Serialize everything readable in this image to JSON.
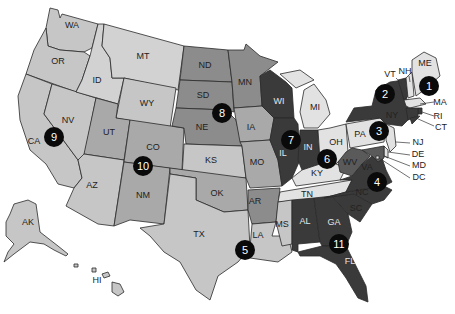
{
  "map": {
    "title": "United States map",
    "shade_levels": {
      "lightest": "#e2e2e2",
      "light": "#c6c6c6",
      "medium": "#a9a9a9",
      "medium_dark": "#8c8c8c",
      "dark": "#5a5a5a",
      "darkest": "#3a3a3a"
    },
    "states": {
      "WA": "WA",
      "OR": "OR",
      "CA": "CA",
      "NV": "NV",
      "ID": "ID",
      "MT": "MT",
      "WY": "WY",
      "UT": "UT",
      "AZ": "AZ",
      "CO": "CO",
      "NM": "NM",
      "ND": "ND",
      "SD": "SD",
      "NE": "NE",
      "KS": "KS",
      "OK": "OK",
      "TX": "TX",
      "MN": "MN",
      "IA": "IA",
      "MO": "MO",
      "AR": "AR",
      "LA": "LA",
      "WI": "WI",
      "IL": "IL",
      "MI": "MI",
      "IN": "IN",
      "OH": "OH",
      "KY": "KY",
      "TN": "TN",
      "MS": "MS",
      "AL": "AL",
      "GA": "GA",
      "FL": "FL",
      "SC": "SC",
      "NC": "NC",
      "VA": "VA",
      "WV": "WV",
      "PA": "PA",
      "NY": "NY",
      "VT": "VT",
      "NH": "NH",
      "ME": "ME",
      "MA": "MA",
      "RI": "RI",
      "CT": "CT",
      "NJ": "NJ",
      "DE": "DE",
      "MD": "MD",
      "DC": "DC",
      "AK": "AK",
      "HI": "HI"
    },
    "markers": [
      {
        "number": "1",
        "state": "ME"
      },
      {
        "number": "2",
        "state": "NY"
      },
      {
        "number": "3",
        "state": "PA"
      },
      {
        "number": "4",
        "state": "VA"
      },
      {
        "number": "5",
        "state": "LA"
      },
      {
        "number": "6",
        "state": "KY"
      },
      {
        "number": "7",
        "state": "IL"
      },
      {
        "number": "8",
        "state": "SD"
      },
      {
        "number": "9",
        "state": "CA"
      },
      {
        "number": "10",
        "state": "CO"
      },
      {
        "number": "11",
        "state": "GA"
      }
    ]
  }
}
